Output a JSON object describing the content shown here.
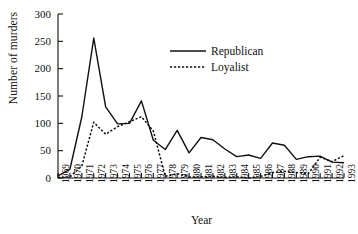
{
  "chart_data": {
    "type": "line",
    "title": "",
    "xlabel": "Year",
    "ylabel": "Number of murders",
    "xlim": [
      1969,
      1993
    ],
    "ylim": [
      0,
      300
    ],
    "yticks": [
      0,
      50,
      100,
      150,
      200,
      250,
      300
    ],
    "grid": false,
    "legend_position": "upper-center",
    "x": [
      1969,
      1970,
      1971,
      1972,
      1973,
      1974,
      1975,
      1976,
      1977,
      1978,
      1979,
      1980,
      1981,
      1982,
      1983,
      1984,
      1985,
      1986,
      1987,
      1988,
      1989,
      1990,
      1991,
      1992,
      1993
    ],
    "categories": [
      "1969",
      "1970",
      "1971",
      "1972",
      "1973",
      "1974",
      "1975",
      "1976",
      "1977",
      "1978",
      "1979",
      "1980",
      "1981",
      "1982",
      "1983",
      "1984",
      "1985",
      "1986",
      "1987",
      "1988",
      "1989",
      "1990",
      "1991",
      "1992",
      "1993"
    ],
    "series": [
      {
        "name": "Republican",
        "style": "solid",
        "color": "#111111",
        "values": [
          4,
          16,
          112,
          256,
          130,
          99,
          100,
          141,
          69,
          52,
          87,
          46,
          74,
          70,
          53,
          39,
          42,
          36,
          64,
          60,
          34,
          39,
          40,
          29,
          28
        ]
      },
      {
        "name": "Loyalist",
        "style": "dotted",
        "color": "#111111",
        "values": [
          1,
          2,
          22,
          102,
          80,
          94,
          103,
          112,
          86,
          3,
          8,
          2,
          2,
          3,
          1,
          2,
          0,
          3,
          10,
          12,
          10,
          8,
          38,
          30,
          41
        ]
      }
    ]
  },
  "legend": {
    "items": [
      {
        "label": "Republican",
        "style": "solid"
      },
      {
        "label": "Loyalist",
        "style": "dotted"
      }
    ]
  }
}
